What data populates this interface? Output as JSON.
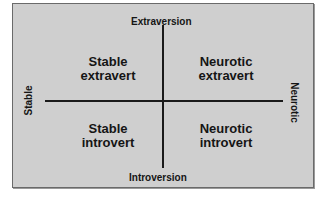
{
  "diagram": {
    "type": "quadrant",
    "axes": {
      "top": "Extraversion",
      "bottom": "Introversion",
      "left": "Stable",
      "right": "Neurotic"
    },
    "quadrants": {
      "top_left": {
        "line1": "Stable",
        "line2": "extravert"
      },
      "top_right": {
        "line1": "Neurotic",
        "line2": "extravert"
      },
      "bottom_left": {
        "line1": "Stable",
        "line2": "introvert"
      },
      "bottom_right": {
        "line1": "Neurotic",
        "line2": "introvert"
      }
    },
    "colors": {
      "background": "#cfcfcf",
      "lines": "#1a1a1a",
      "text": "#151515"
    }
  }
}
